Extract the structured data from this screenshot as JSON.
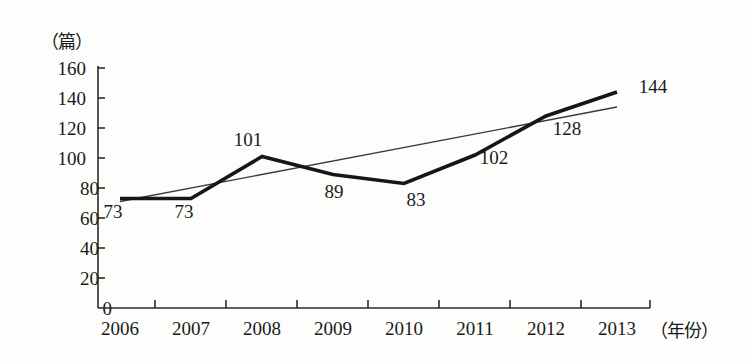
{
  "chart_data": {
    "type": "line",
    "title": "",
    "xlabel": "（年份）",
    "ylabel": "（篇）",
    "categories": [
      "2006",
      "2007",
      "2008",
      "2009",
      "2010",
      "2011",
      "2012",
      "2013"
    ],
    "values": [
      73,
      73,
      101,
      89,
      83,
      102,
      128,
      144
    ],
    "point_labels": [
      "73",
      "73",
      "101",
      "89",
      "83",
      "102",
      "128",
      "144"
    ],
    "ylim": [
      0,
      160
    ],
    "y_ticks": [
      "0",
      "20",
      "40",
      "60",
      "80",
      "100",
      "120",
      "140",
      "160"
    ],
    "grid": false,
    "legend": "none",
    "series": [
      {
        "name": "论文数量",
        "type": "line",
        "style": "thick",
        "values": [
          73,
          73,
          101,
          89,
          83,
          102,
          128,
          144
        ]
      },
      {
        "name": "趋势线",
        "type": "trend",
        "style": "thin",
        "values": [
          71,
          80,
          89,
          98,
          107,
          116,
          125,
          134
        ]
      }
    ],
    "colors": {
      "data_line": "#161616",
      "trend_line": "#3a3a3a",
      "axis": "#2b2b2b",
      "text": "#1a1a1a",
      "background": "#fdfdfb"
    }
  }
}
